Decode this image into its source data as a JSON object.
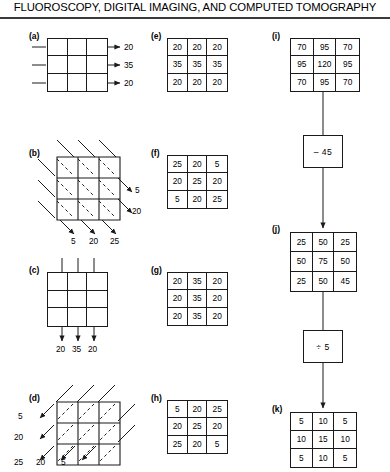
{
  "header": {
    "title": "FLUOROSCOPY, DIGITAL IMAGING, AND COMPUTED TOMOGRAPHY"
  },
  "panels": {
    "a": {
      "label": "(a)",
      "type": "empty-grid",
      "arrow_direction": "left-to-right",
      "outputs_right": [
        "20",
        "35",
        "20"
      ]
    },
    "b": {
      "label": "(b)",
      "type": "empty-grid-skewed",
      "arrow_direction": "diagonal-down-right",
      "outputs_right": [
        "5",
        "20"
      ],
      "outputs_bottom": [
        "5",
        "20",
        "25"
      ]
    },
    "c": {
      "label": "(c)",
      "type": "empty-grid",
      "arrow_direction": "top-to-bottom",
      "outputs_bottom": [
        "20",
        "35",
        "20"
      ]
    },
    "d": {
      "label": "(d)",
      "type": "empty-grid-skewed",
      "arrow_direction": "diagonal-down-left",
      "outputs_left": [
        "5",
        "20"
      ],
      "outputs_bottom": [
        "25",
        "20",
        "5"
      ]
    },
    "e": {
      "label": "(e)",
      "type": "value-grid",
      "rows": [
        [
          "20",
          "20",
          "20"
        ],
        [
          "35",
          "35",
          "35"
        ],
        [
          "20",
          "20",
          "20"
        ]
      ]
    },
    "f": {
      "label": "(f)",
      "type": "value-grid",
      "rows": [
        [
          "25",
          "20",
          "5"
        ],
        [
          "20",
          "25",
          "20"
        ],
        [
          "5",
          "20",
          "25"
        ]
      ]
    },
    "g": {
      "label": "(g)",
      "type": "value-grid",
      "rows": [
        [
          "20",
          "35",
          "20"
        ],
        [
          "20",
          "35",
          "20"
        ],
        [
          "20",
          "35",
          "20"
        ]
      ]
    },
    "h": {
      "label": "(h)",
      "type": "value-grid",
      "rows": [
        [
          "5",
          "20",
          "25"
        ],
        [
          "20",
          "25",
          "20"
        ],
        [
          "25",
          "20",
          "5"
        ]
      ]
    },
    "i": {
      "label": "(i)",
      "type": "value-grid",
      "rows": [
        [
          "70",
          "95",
          "70"
        ],
        [
          "95",
          "120",
          "95"
        ],
        [
          "70",
          "95",
          "70"
        ]
      ]
    },
    "j": {
      "label": "(j)",
      "type": "value-grid",
      "rows": [
        [
          "25",
          "50",
          "25"
        ],
        [
          "50",
          "75",
          "50"
        ],
        [
          "25",
          "50",
          "45"
        ]
      ]
    },
    "k": {
      "label": "(k)",
      "type": "value-grid",
      "rows": [
        [
          "5",
          "10",
          "5"
        ],
        [
          "10",
          "15",
          "10"
        ],
        [
          "5",
          "10",
          "5"
        ]
      ]
    }
  },
  "operations": {
    "subtract": {
      "label": "– 45"
    },
    "divide": {
      "label": "÷ 5"
    }
  },
  "colors": {
    "ink": "#1a1a1a",
    "rule": "#3a3a3a",
    "background": "#ffffff"
  }
}
